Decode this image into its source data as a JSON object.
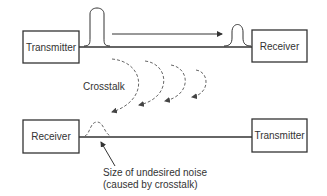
{
  "top_link": {
    "left_box": "Transmitter",
    "right_box": "Receiver"
  },
  "bottom_link": {
    "left_box": "Receiver",
    "right_box": "Transmitter"
  },
  "crosstalk_label": "Crosstalk",
  "noise_annotation": {
    "line1": "Size of undesired noise",
    "line2": "(caused by crosstalk)"
  },
  "colors": {
    "stroke": "#333333",
    "dashed": "#666666",
    "background": "#ffffff"
  }
}
